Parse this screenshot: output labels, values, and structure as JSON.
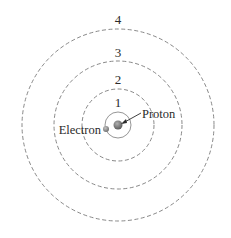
{
  "diagram": {
    "center": {
      "x": 118,
      "y": 125
    },
    "orbits": [
      {
        "n": "1",
        "r": 13,
        "style": "solid",
        "label_y": 107
      },
      {
        "n": "2",
        "r": 36,
        "style": "dashed",
        "label_y": 84
      },
      {
        "n": "3",
        "r": 64,
        "style": "dashed",
        "label_y": 57
      },
      {
        "n": "4",
        "r": 96,
        "style": "dashed",
        "label_y": 24
      }
    ],
    "labels": {
      "proton": "Proton",
      "electron": "Electron",
      "orbit_1": "1",
      "orbit_2": "2",
      "orbit_3": "3",
      "orbit_4": "4"
    },
    "colors": {
      "orbit_stroke": "#7a7a7a",
      "proton_fill": "#6e6e6e",
      "electron_fill": "#8a8a8a",
      "text": "#2b2b2b"
    }
  }
}
